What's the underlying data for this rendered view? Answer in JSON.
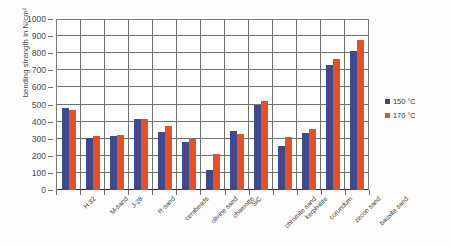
{
  "chart_data": {
    "type": "bar",
    "title": "",
    "xlabel": "",
    "ylabel": "bending strength in N/cm²",
    "ylim": [
      0,
      1000
    ],
    "ystep": 100,
    "grid": true,
    "legend_position": "right",
    "categories": [
      "H 32",
      "M-sand",
      "J-28",
      "R-sand",
      "cerabeads",
      "olivine sand",
      "chamotte",
      "SiC",
      "chromite sand",
      "kerphalite",
      "corundum",
      "zircon sand",
      "bauxite sand"
    ],
    "series": [
      {
        "name": "150 °C",
        "color": "#3d4b8e",
        "values": [
          480,
          303,
          315,
          418,
          340,
          278,
          118,
          345,
          500,
          260,
          333,
          730,
          815
        ]
      },
      {
        "name": "170 °C",
        "color": "#e1512a",
        "values": [
          468,
          315,
          322,
          418,
          372,
          297,
          210,
          325,
          518,
          310,
          355,
          765,
          875
        ]
      }
    ],
    "yticks": [
      0,
      100,
      200,
      300,
      400,
      500,
      600,
      700,
      800,
      900,
      1000
    ]
  },
  "legend": {
    "items": [
      {
        "label": "150 °C",
        "series": 0
      },
      {
        "label": "170 °C",
        "series": 1
      }
    ]
  }
}
